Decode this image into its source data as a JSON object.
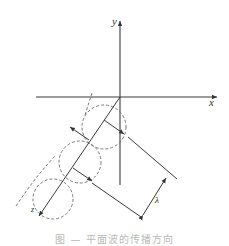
{
  "figure": {
    "labels": {
      "x_axis": "x",
      "y_axis": "y",
      "wavelength": "λ",
      "direction": "z"
    },
    "caption": "图 — 平面波的传播方向"
  }
}
